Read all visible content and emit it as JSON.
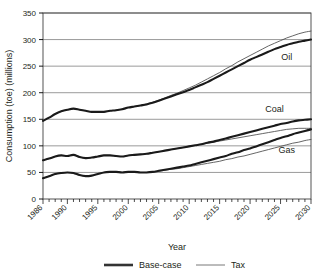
{
  "chart_data": {
    "type": "line",
    "title": "",
    "xlabel": "Year",
    "ylabel": "Consumption (toe) (millions)",
    "xlim": [
      1986,
      2030
    ],
    "ylim": [
      0,
      350
    ],
    "yticks": [
      0,
      50,
      100,
      150,
      200,
      250,
      300,
      350
    ],
    "xticks": [
      1986,
      1990,
      1995,
      2000,
      2005,
      2010,
      2015,
      2020,
      2025,
      2030
    ],
    "xtick_labels": [
      "1986",
      "1990",
      "1995",
      "2000",
      "2005",
      "2010",
      "2015",
      "2020",
      "2025",
      "2030"
    ],
    "ytick_labels": [
      "0",
      "50",
      "100",
      "150",
      "200",
      "250",
      "300",
      "350"
    ],
    "grid": "horizontal",
    "legend_position": "bottom",
    "minor_ticks": "yearly",
    "annotations": [
      {
        "text": "Oil",
        "x": 2026,
        "y": 262
      },
      {
        "text": "Coal",
        "x": 2024,
        "y": 163
      },
      {
        "text": "Gas",
        "x": 2026,
        "y": 86
      }
    ],
    "legend": [
      {
        "name": "Base-case",
        "style": "thick"
      },
      {
        "name": "Tax",
        "style": "thin"
      }
    ],
    "x": [
      1986,
      1987,
      1988,
      1989,
      1990,
      1991,
      1992,
      1993,
      1994,
      1995,
      1996,
      1997,
      1998,
      1999,
      2000,
      2001,
      2002,
      2003,
      2004,
      2005,
      2006,
      2007,
      2008,
      2009,
      2010,
      2011,
      2012,
      2013,
      2014,
      2015,
      2016,
      2017,
      2018,
      2019,
      2020,
      2021,
      2022,
      2023,
      2024,
      2025,
      2026,
      2027,
      2028,
      2029,
      2030
    ],
    "series": [
      {
        "name": "Oil Base-case",
        "commodity": "Oil",
        "scenario": "Base-case",
        "style": "thick",
        "values": [
          147,
          153,
          160,
          165,
          168,
          170,
          168,
          166,
          164,
          164,
          164,
          166,
          167,
          169,
          172,
          174,
          176,
          178,
          181,
          185,
          189,
          193,
          197,
          201,
          205,
          210,
          215,
          220,
          226,
          232,
          238,
          244,
          250,
          256,
          262,
          267,
          272,
          277,
          282,
          286,
          290,
          293,
          296,
          298,
          300
        ]
      },
      {
        "name": "Oil Tax",
        "commodity": "Oil",
        "scenario": "Tax",
        "style": "thin",
        "values": [
          147,
          153,
          160,
          165,
          168,
          170,
          168,
          166,
          164,
          164,
          164,
          166,
          167,
          169,
          172,
          174,
          176,
          179,
          182,
          186,
          190,
          195,
          199,
          204,
          209,
          214,
          220,
          226,
          232,
          238,
          245,
          251,
          258,
          264,
          270,
          276,
          282,
          288,
          293,
          298,
          303,
          307,
          311,
          314,
          316
        ]
      },
      {
        "name": "Coal Base-case",
        "commodity": "Coal",
        "scenario": "Base-case",
        "style": "thick",
        "values": [
          73,
          76,
          80,
          82,
          81,
          83,
          79,
          77,
          78,
          80,
          82,
          82,
          81,
          80,
          82,
          83,
          84,
          85,
          87,
          89,
          91,
          93,
          95,
          97,
          99,
          101,
          103,
          106,
          108,
          111,
          114,
          117,
          120,
          123,
          126,
          129,
          132,
          135,
          138,
          141,
          143,
          146,
          148,
          149,
          150
        ]
      },
      {
        "name": "Coal Tax",
        "commodity": "Coal",
        "scenario": "Tax",
        "style": "thin",
        "values": [
          73,
          76,
          80,
          82,
          81,
          83,
          79,
          77,
          78,
          80,
          82,
          82,
          81,
          80,
          82,
          83,
          84,
          85,
          87,
          89,
          91,
          93,
          95,
          97,
          99,
          101,
          103,
          105,
          107,
          109,
          111,
          113,
          115,
          117,
          119,
          121,
          123,
          125,
          127,
          129,
          131,
          132,
          133,
          133,
          133
        ]
      },
      {
        "name": "Gas Base-case",
        "commodity": "Gas",
        "scenario": "Base-case",
        "style": "thick",
        "values": [
          39,
          43,
          47,
          49,
          50,
          49,
          45,
          43,
          44,
          47,
          50,
          51,
          51,
          50,
          51,
          51,
          50,
          50,
          51,
          53,
          55,
          57,
          59,
          61,
          63,
          66,
          69,
          72,
          75,
          78,
          81,
          85,
          88,
          92,
          95,
          99,
          103,
          107,
          111,
          115,
          118,
          122,
          125,
          128,
          131
        ]
      },
      {
        "name": "Gas Tax",
        "commodity": "Gas",
        "scenario": "Tax",
        "style": "thin",
        "values": [
          39,
          43,
          47,
          49,
          50,
          49,
          45,
          43,
          44,
          47,
          50,
          51,
          51,
          50,
          51,
          51,
          50,
          50,
          51,
          52,
          54,
          56,
          57,
          59,
          61,
          63,
          65,
          67,
          69,
          71,
          74,
          76,
          79,
          81,
          84,
          87,
          90,
          93,
          96,
          99,
          102,
          105,
          107,
          110,
          112
        ]
      }
    ]
  },
  "axes": {
    "ylabel": "Consumption (toe) (millions)",
    "xlabel": "Year"
  },
  "legend": {
    "base_case_label": "Base-case",
    "tax_label": "Tax"
  },
  "series_labels": {
    "oil": "Oil",
    "coal": "Coal",
    "gas": "Gas"
  },
  "colors": {
    "line": "#1a1a1a",
    "grid": "#808080",
    "axis": "#000000",
    "text": "#231f20",
    "background": "#ffffff"
  }
}
